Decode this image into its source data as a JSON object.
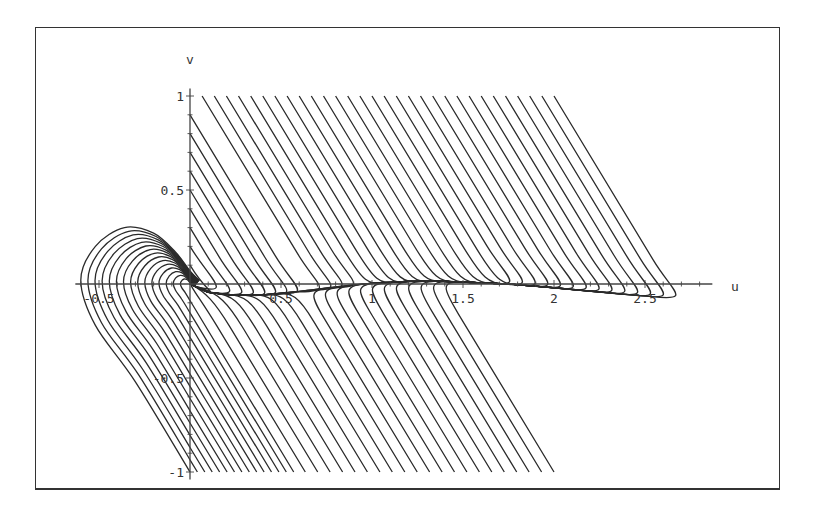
{
  "figure": {
    "frame": {
      "x": 35,
      "y": 27,
      "w": 746,
      "h": 464
    },
    "colors": {
      "curve": "#2a2a2a",
      "axis": "#444444",
      "text": "#333333",
      "frame": "#333333",
      "background": "#ffffff"
    }
  },
  "chart_data": {
    "type": "line",
    "title": "",
    "xlabel": "u",
    "ylabel": "v",
    "xlim": [
      -0.63,
      2.87
    ],
    "ylim": [
      -1.04,
      1.04
    ],
    "grid": false,
    "legend": null,
    "x_ticks": [
      {
        "value": -0.5,
        "label": "-0.5"
      },
      {
        "value": 0.5,
        "label": "0.5"
      },
      {
        "value": 1,
        "label": "1"
      },
      {
        "value": 1.5,
        "label": "1.5"
      },
      {
        "value": 2,
        "label": "2"
      },
      {
        "value": 2.5,
        "label": "2.5"
      }
    ],
    "y_ticks": [
      {
        "value": -1,
        "label": "-1"
      },
      {
        "value": -0.5,
        "label": "-0.5"
      },
      {
        "value": 0.5,
        "label": "0.5"
      },
      {
        "value": 1,
        "label": "1"
      }
    ],
    "minor_tick_step": 0.1,
    "straight_slope": -1.6,
    "slow_manifold": [
      [
        0,
        0
      ],
      [
        0.1,
        -0.045
      ],
      [
        0.25,
        -0.06
      ],
      [
        0.4,
        -0.058
      ],
      [
        0.6,
        -0.04
      ],
      [
        0.8,
        -0.015
      ],
      [
        1.0,
        0.004
      ],
      [
        1.2,
        0.014
      ],
      [
        1.4,
        0.014
      ],
      [
        1.6,
        0.006
      ],
      [
        1.75,
        0
      ],
      [
        2.0,
        -0.02
      ],
      [
        2.2,
        -0.038
      ],
      [
        2.4,
        -0.056
      ],
      [
        2.6,
        -0.072
      ],
      [
        2.8,
        -0.08
      ]
    ],
    "equilibria": [
      {
        "u": 0,
        "v": 0
      },
      {
        "u": 1.75,
        "v": 0
      }
    ],
    "series": [
      {
        "name": "top-family (start v=1)",
        "start_v": 1,
        "start_u_from": 0.0667,
        "start_u_to": 2.0,
        "count": 30
      },
      {
        "name": "axis-family (start u=0)",
        "start_u": 0,
        "start_v": [
          0.9,
          0.8,
          0.7,
          0.6,
          0.5,
          0.4,
          0.3,
          0.2,
          0.1
        ]
      },
      {
        "name": "bottom-loop-family (start v=-1)",
        "start_v": -1,
        "start_u_from": 0.0,
        "start_u_to": 0.57,
        "count": 15
      },
      {
        "name": "bottom-family (start v=-1)",
        "start_v": -1,
        "start_u_from": 0.6333,
        "start_u_to": 2.0,
        "count": 21
      }
    ],
    "loop_template": [
      [
        0,
        -1
      ],
      [
        -0.3,
        -0.52
      ],
      [
        -0.52,
        -0.22
      ],
      [
        -0.6,
        0.02
      ],
      [
        -0.52,
        0.2
      ],
      [
        -0.36,
        0.3
      ],
      [
        -0.2,
        0.27
      ],
      [
        -0.08,
        0.17
      ],
      [
        0.0,
        0.07
      ],
      [
        0.05,
        0.02
      ]
    ]
  },
  "labels": {
    "x_axis": "u",
    "y_axis": "v"
  }
}
